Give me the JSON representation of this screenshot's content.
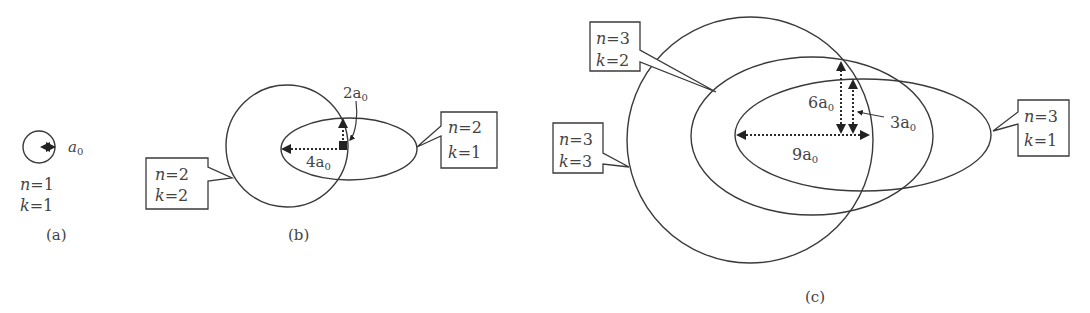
{
  "figure": {
    "panels": [
      {
        "id": "a",
        "caption": "(a)",
        "orbits": [
          {
            "n": "1",
            "k": "1",
            "shape": "circle"
          }
        ],
        "labels": {
          "n_text": "n=1",
          "k_text": "k=1",
          "radius": "a₀"
        }
      },
      {
        "id": "b",
        "caption": "(b)",
        "orbits": [
          {
            "n": "2",
            "k": "2",
            "shape": "circle",
            "callout": "n=2 / k=2"
          },
          {
            "n": "2",
            "k": "1",
            "shape": "ellipse",
            "callout": "n=2 / k=1"
          }
        ],
        "dimensions": {
          "major": "4a₀",
          "minor": "2a₀"
        }
      },
      {
        "id": "c",
        "caption": "(c)",
        "orbits": [
          {
            "n": "3",
            "k": "3",
            "shape": "circle",
            "callout": "n=3 / k=3"
          },
          {
            "n": "3",
            "k": "2",
            "shape": "ellipse",
            "callout": "n=3 / k=2"
          },
          {
            "n": "3",
            "k": "1",
            "shape": "ellipse",
            "callout": "n=3 / k=1"
          }
        ],
        "dimensions": {
          "major": "9a₀",
          "k2": "6a₀",
          "k1": "3a₀"
        }
      }
    ]
  },
  "text": {
    "a_n": "n",
    "a_n_val": "=1",
    "a_k": "k",
    "a_k_val": "=1",
    "a_radius": "a",
    "sub0": "0",
    "cap_a": "(a)",
    "cap_b": "(b)",
    "cap_c": "(c)",
    "b_c1_n": "=2",
    "b_c1_k": "=2",
    "b_c2_n": "=2",
    "b_c2_k": "=1",
    "b_major": "4a",
    "b_minor": "2a",
    "c_c1_n": "=3",
    "c_c1_k": "=2",
    "c_c2_n": "=3",
    "c_c2_k": "=3",
    "c_c3_n": "=3",
    "c_c3_k": "=1",
    "c_major": "9a",
    "c_k2": "6a",
    "c_k1": "3a",
    "n": "n",
    "k": "k"
  }
}
